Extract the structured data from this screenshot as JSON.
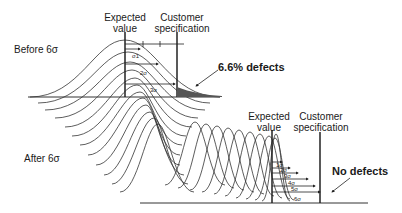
{
  "top": {
    "row_label": "Before 6σ",
    "expected_value_label": [
      "Expected",
      "value"
    ],
    "customer_spec_label": [
      "Customer",
      "specification"
    ],
    "sigma_marks": [
      "σ1",
      "2σ",
      "3σ"
    ],
    "annotation": "6.6% defects"
  },
  "bottom": {
    "row_label": "After 6σ",
    "expected_value_label": [
      "Expected",
      "value"
    ],
    "customer_spec_label": [
      "Customer",
      "specification"
    ],
    "sigma_marks": [
      "1σ",
      "2σ",
      "3σ",
      "4σ",
      "5σ",
      "6σ"
    ],
    "annotation": "No defects"
  },
  "colors": {
    "line": "#333333",
    "shade": "#555555",
    "background": "#ffffff"
  }
}
